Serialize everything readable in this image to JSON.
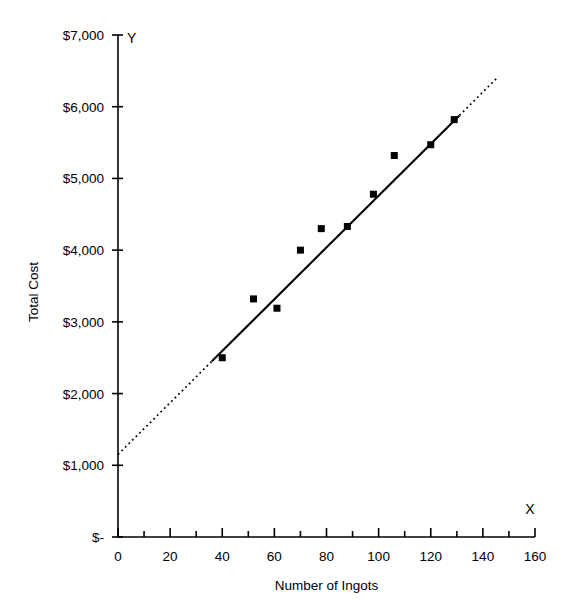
{
  "chart_data": {
    "type": "scatter",
    "title": "",
    "xlabel": "Number of Ingots",
    "ylabel": "Total Cost",
    "xlim": [
      0,
      160
    ],
    "ylim": [
      0,
      7000
    ],
    "grid": false,
    "legend": "none",
    "x_axis_letter": "X",
    "y_axis_letter": "Y",
    "x_ticks": [
      0,
      20,
      40,
      60,
      80,
      100,
      120,
      140,
      160
    ],
    "x_tick_labels": [
      "0",
      "20",
      "40",
      "60",
      "80",
      "100",
      "120",
      "140",
      "160"
    ],
    "x_minor_tick_step": 10,
    "y_ticks": [
      0,
      1000,
      2000,
      3000,
      4000,
      5000,
      6000,
      7000
    ],
    "y_tick_labels": [
      "$-",
      "$1,000",
      "$2,000",
      "$3,000",
      "$4,000",
      "$5,000",
      "$6,000",
      "$7,000"
    ],
    "marker": "square",
    "marker_color": "#000000",
    "marker_size_px": 7,
    "points": [
      {
        "x": 40,
        "y": 2500
      },
      {
        "x": 52,
        "y": 3320
      },
      {
        "x": 61,
        "y": 3190
      },
      {
        "x": 70,
        "y": 4000
      },
      {
        "x": 78,
        "y": 4300
      },
      {
        "x": 88,
        "y": 4330
      },
      {
        "x": 98,
        "y": 4780
      },
      {
        "x": 106,
        "y": 5320
      },
      {
        "x": 120,
        "y": 5470
      },
      {
        "x": 129,
        "y": 5820
      }
    ],
    "trend_line": {
      "label": "",
      "color": "#000000",
      "intercept": 1150,
      "slope": 36.1,
      "solid_x_range": [
        36,
        131
      ],
      "dotted_x_ranges": [
        [
          0,
          36
        ],
        [
          131,
          146
        ]
      ],
      "style_solid": "solid",
      "style_extrapolation": "dotted"
    }
  }
}
